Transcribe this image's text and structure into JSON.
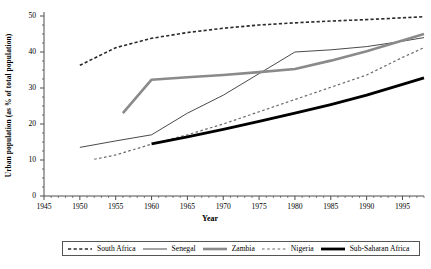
{
  "chart_data": {
    "type": "line",
    "title": "",
    "xlabel": "Year",
    "ylabel": "Urban population (as % of total population)",
    "xlim": [
      1945,
      1998
    ],
    "ylim": [
      0,
      50
    ],
    "xticks": [
      "1945",
      "1950",
      "1955",
      "1960",
      "1965",
      "1970",
      "1975",
      "1980",
      "1985",
      "1990",
      "1995"
    ],
    "yticks": [
      "0",
      "10",
      "20",
      "30",
      "40",
      "50"
    ],
    "grid": false,
    "legend_position": "bottom",
    "series": [
      {
        "name": "South Africa",
        "style": "dashed",
        "color": "#2b2b2b",
        "width": 1.6,
        "x": [
          1950,
          1955,
          1960,
          1965,
          1970,
          1975,
          1980,
          1985,
          1990,
          1995,
          1998
        ],
        "values": [
          36.3,
          41.2,
          43.8,
          45.4,
          46.6,
          47.5,
          48.1,
          48.6,
          49.0,
          49.5,
          49.8
        ]
      },
      {
        "name": "Senegal",
        "style": "solid",
        "color": "#4a4a4a",
        "width": 1.0,
        "x": [
          1950,
          1955,
          1960,
          1965,
          1970,
          1975,
          1980,
          1985,
          1990,
          1995,
          1998
        ],
        "values": [
          13.5,
          15.3,
          17.0,
          23.0,
          28.0,
          34.0,
          40.0,
          40.6,
          41.5,
          43.0,
          44.0
        ]
      },
      {
        "name": "Zambia",
        "style": "solid",
        "color": "#8a8a8a",
        "width": 2.6,
        "x": [
          1956,
          1960,
          1965,
          1970,
          1975,
          1980,
          1985,
          1990,
          1995,
          1998
        ],
        "values": [
          23.0,
          32.3,
          33.0,
          33.6,
          34.4,
          35.3,
          37.6,
          40.2,
          43.2,
          45.0
        ]
      },
      {
        "name": "Nigeria",
        "style": "dashed",
        "color": "#6b6b6b",
        "width": 1.2,
        "x": [
          1952,
          1955,
          1960,
          1965,
          1970,
          1975,
          1980,
          1985,
          1990,
          1995,
          1998
        ],
        "values": [
          10.2,
          11.4,
          14.4,
          17.0,
          20.0,
          23.4,
          26.8,
          30.2,
          33.6,
          38.5,
          41.2
        ]
      },
      {
        "name": "Sub-Saharan Africa",
        "style": "solid",
        "color": "#000000",
        "width": 2.8,
        "x": [
          1960,
          1965,
          1970,
          1975,
          1980,
          1985,
          1990,
          1995,
          1998
        ],
        "values": [
          14.5,
          16.4,
          18.5,
          20.7,
          23.0,
          25.4,
          28.0,
          31.0,
          32.8
        ]
      }
    ]
  },
  "legend": {
    "items": [
      {
        "label": "South Africa",
        "style": "dashed",
        "color": "#2b2b2b",
        "width": 1.6
      },
      {
        "label": "Senegal",
        "style": "solid",
        "color": "#4a4a4a",
        "width": 1.0
      },
      {
        "label": "Zambia",
        "style": "solid",
        "color": "#8a8a8a",
        "width": 2.6
      },
      {
        "label": "Nigeria",
        "style": "dashed",
        "color": "#6b6b6b",
        "width": 1.2
      },
      {
        "label": "Sub-Saharan Africa",
        "style": "solid",
        "color": "#000000",
        "width": 2.8
      }
    ]
  },
  "axis": {
    "color": "#4d4d4d",
    "tick_color": "#4d4d4d"
  }
}
